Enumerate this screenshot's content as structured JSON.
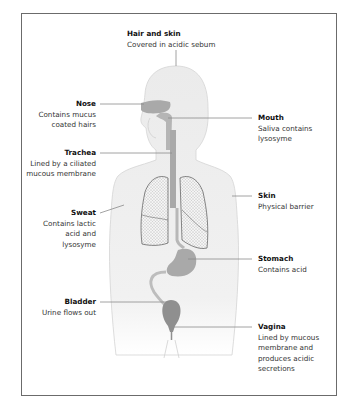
{
  "diagram": {
    "labels": [
      {
        "id": "hair-skin",
        "title": "Hair and skin",
        "desc": "Covered in acidic sebum"
      },
      {
        "id": "nose",
        "title": "Nose",
        "desc": "Contains mucus coated hairs"
      },
      {
        "id": "mouth",
        "title": "Mouth",
        "desc": "Saliva contains lysosyme"
      },
      {
        "id": "trachea",
        "title": "Trachea",
        "desc": "Lined by a ciliated mucous membrane"
      },
      {
        "id": "skin",
        "title": "Skin",
        "desc": "Physical barrier"
      },
      {
        "id": "sweat",
        "title": "Sweat",
        "desc": "Contains lactic acid and lysosyme"
      },
      {
        "id": "stomach",
        "title": "Stomach",
        "desc": "Contains acid"
      },
      {
        "id": "bladder",
        "title": "Bladder",
        "desc": "Urine flows out"
      },
      {
        "id": "vagina",
        "title": "Vagina",
        "desc": "Lined by mucous membrane and produces acidic secretions"
      }
    ],
    "colors": {
      "body_fill": "#ededed",
      "organ_fill": "#a9a9a9",
      "leader_line": "#8a8a8a",
      "frame": "#6b6b6b"
    }
  }
}
